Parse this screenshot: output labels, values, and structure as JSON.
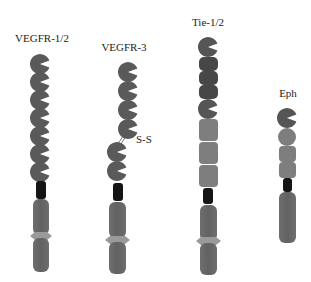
{
  "receptors": [
    {
      "name": "VEGFR-1/2",
      "label_x": 42,
      "label_y": 32,
      "domains": "7 Ig-like domains, transmembrane, split tyrosine kinase"
    },
    {
      "name": "VEGFR-3",
      "label_x": 124,
      "label_y": 41,
      "domains": "4 Ig-like domains, S-S disulfide link, 2 Ig-like domains, transmembrane, split tyrosine kinase"
    },
    {
      "name": "Tie-1/2",
      "label_x": 208,
      "label_y": 16,
      "domains": "Ig-like, 3 EGF-like, Ig-like, 3 fibronectin type III, transmembrane, split tyrosine kinase"
    },
    {
      "name": "Eph",
      "label_x": 288,
      "label_y": 87,
      "domains": "Ig-like ligand-binding, cysteine-rich, 2 fibronectin type III, transmembrane, tyrosine kinase"
    }
  ],
  "annotations": {
    "disulfide": "S-S"
  },
  "colors": {
    "ig_domain": "#5a5a5a",
    "egf_domain": "#474747",
    "fn_domain": "#7e7e7e",
    "transmembrane": "#151515",
    "kinase": "#666666",
    "kinase_insert": "#9a9a9a",
    "background": "#ffffff"
  }
}
